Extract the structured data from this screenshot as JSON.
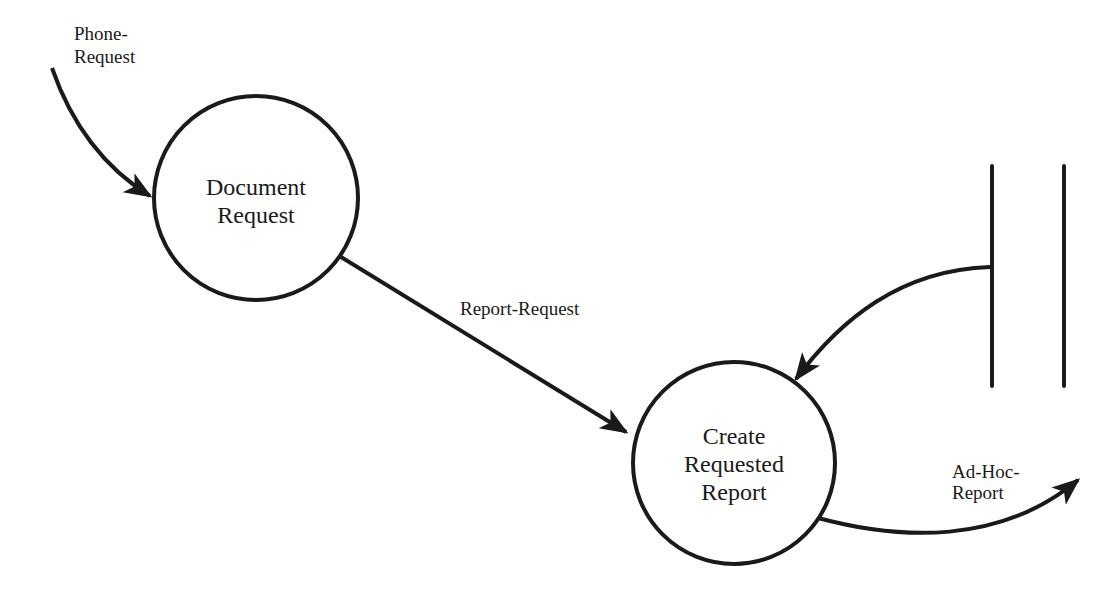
{
  "diagram": {
    "type": "data-flow-diagram",
    "processes": [
      {
        "id": "p1",
        "line1": "Document",
        "line2": "Request"
      },
      {
        "id": "p2",
        "line1": "Create",
        "line2": "Requested",
        "line3": "Report"
      }
    ],
    "flows": [
      {
        "id": "f1",
        "line1": "Phone-",
        "line2": "Request",
        "from": "external",
        "to": "p1"
      },
      {
        "id": "f2",
        "label": "Report-Request",
        "from": "p1",
        "to": "p2"
      },
      {
        "id": "f3",
        "from": "data-store",
        "to": "p2"
      },
      {
        "id": "f4",
        "line1": "Ad-Hoc-",
        "line2": "Report",
        "from": "p2",
        "to": "external"
      }
    ],
    "data_store": {
      "id": "ds1",
      "label": ""
    },
    "colors": {
      "ink": "#1a1a1a",
      "background": "#ffffff"
    }
  }
}
